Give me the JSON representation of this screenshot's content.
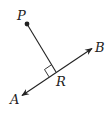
{
  "diagram": {
    "points": {
      "P": {
        "label": "P",
        "x": 27,
        "y": 24
      },
      "R": {
        "label": "R",
        "x": 56,
        "y": 72
      },
      "A": {
        "label": "A",
        "x": 21,
        "y": 96
      },
      "B": {
        "label": "B",
        "x": 93,
        "y": 48
      }
    },
    "right_angle_marker": true,
    "colors": {
      "stroke": "#222222",
      "background": "#ffffff"
    }
  }
}
